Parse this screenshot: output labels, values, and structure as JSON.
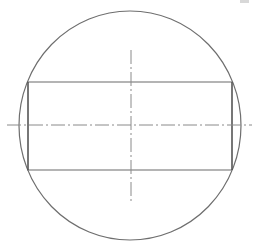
{
  "drawing": {
    "type": "technical-section-view",
    "description": "Circle with inscribed rectangle and dash-dot center lines",
    "colors": {
      "outline": "#6e6e6e",
      "rectangle": "#6a6a6a",
      "centerline": "#8a8a8a",
      "background": "#ffffff"
    },
    "circle": {
      "cx": 130,
      "cy": 125.5,
      "rx": 111,
      "ry": 114.5
    },
    "rectangle": {
      "x": 27,
      "y": 82,
      "width": 205,
      "height": 88
    },
    "centerlines": {
      "horizontal": {
        "x1": 7,
        "x2": 252,
        "y": 125
      },
      "vertical": {
        "x": 131,
        "y1": 50,
        "y2": 201
      }
    }
  }
}
